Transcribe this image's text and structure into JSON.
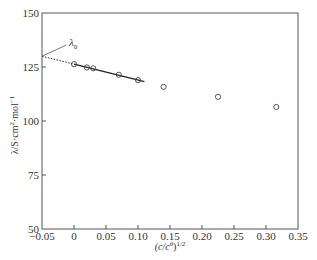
{
  "chart_data": {
    "type": "scatter",
    "title": "",
    "xlabel": "(c/cθ)^1/2",
    "xlabel_parts": {
      "base": "(c/c",
      "sup1": "θ",
      "mid": ")",
      "sup2": "1/2"
    },
    "ylabel": "λ/S·cm²·mol⁻¹",
    "ylabel_parts": {
      "base": "λ/S·cm",
      "sup1": "2",
      "mid": "·mol",
      "sup2": "−1"
    },
    "xlim": [
      -0.05,
      0.35
    ],
    "ylim": [
      50,
      150
    ],
    "xticks": [
      -0.05,
      0,
      0.05,
      0.1,
      0.15,
      0.2,
      0.25,
      0.3,
      0.35
    ],
    "xtick_labels": [
      "−0.05",
      "0",
      "0.05",
      "0.10",
      "0.15",
      "0.20",
      "0.25",
      "0.30",
      "0.35"
    ],
    "yticks": [
      50,
      75,
      100,
      125,
      150
    ],
    "ytick_labels": [
      "50",
      "75",
      "100",
      "125",
      "150"
    ],
    "grid": false,
    "series": [
      {
        "name": "measured",
        "marker": "open-circle",
        "x": [
          0.0,
          0.02,
          0.03,
          0.07,
          0.1,
          0.14,
          0.225,
          0.316
        ],
        "y": [
          126.3,
          124.8,
          124.4,
          121.4,
          118.9,
          115.8,
          111.2,
          106.5
        ]
      }
    ],
    "fit_line": {
      "name": "linear fit",
      "solid": {
        "x": [
          0.0,
          0.11
        ],
        "y": [
          126.3,
          118.2
        ]
      },
      "dotted_extrapolation": {
        "x": [
          -0.05,
          0.0
        ],
        "y": [
          130.0,
          126.3
        ]
      }
    },
    "annotations": [
      {
        "text": "λ",
        "subscript": "0",
        "points_to": {
          "x": -0.05,
          "y": 130.0
        }
      }
    ]
  }
}
